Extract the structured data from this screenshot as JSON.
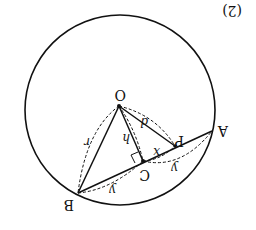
{
  "figure": {
    "number_label": "(2)",
    "rotation_deg": 180,
    "colors": {
      "stroke": "#111111",
      "background": "#ffffff"
    }
  },
  "points": {
    "O": "O",
    "A": "A",
    "B": "B",
    "C": "C",
    "P": "P"
  },
  "edge_labels": {
    "OB_radius": "r",
    "OC_height": "h",
    "OP_distance": "d",
    "PC_segment": "x",
    "CA_segment": "y",
    "BC_segment": "y"
  },
  "right_angle_marker": "OC ⊥ AB at C"
}
